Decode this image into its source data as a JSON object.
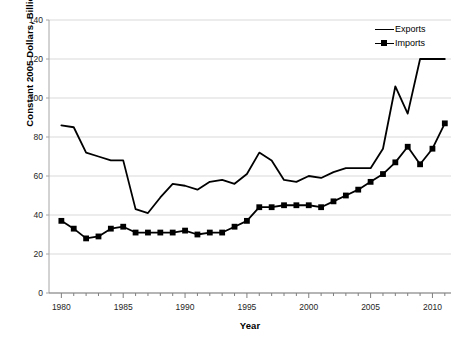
{
  "chart_data": {
    "type": "line",
    "title": "",
    "xlabel": "Year",
    "ylabel": "Constant 2005 Dollars, Billions",
    "xlim": [
      1979,
      2011.5
    ],
    "ylim": [
      0,
      140
    ],
    "ytick_values": [
      0,
      20,
      40,
      60,
      80,
      100,
      120,
      140
    ],
    "ytick_labels": [
      "0",
      "20",
      "40",
      "60",
      "80",
      "100",
      "120",
      "140"
    ],
    "xtick_values": [
      1980,
      1985,
      1990,
      1995,
      2000,
      2005,
      2010
    ],
    "xtick_labels": [
      "1980",
      "1985",
      "1990",
      "1995",
      "2000",
      "2005",
      "2010"
    ],
    "minor_xticks_every": 1,
    "grid": "horizontal",
    "legend_position": "top-right",
    "line_color": "#000000",
    "grid_color": "#d9d9d9",
    "x": [
      1980,
      1981,
      1982,
      1983,
      1984,
      1985,
      1986,
      1987,
      1988,
      1989,
      1990,
      1991,
      1992,
      1993,
      1994,
      1995,
      1996,
      1997,
      1998,
      1999,
      2000,
      2001,
      2002,
      2003,
      2004,
      2005,
      2006,
      2007,
      2008,
      2009,
      2010,
      2011
    ],
    "series": [
      {
        "name": "Exports",
        "marker": "none",
        "values": [
          86,
          85,
          72,
          70,
          68,
          68,
          43,
          41,
          49,
          56,
          55,
          53,
          57,
          58,
          56,
          61,
          72,
          68,
          58,
          57,
          60,
          59,
          62,
          64,
          64,
          64,
          74,
          106,
          92,
          120,
          120,
          120
        ]
      },
      {
        "name": "Imports",
        "marker": "square",
        "values": [
          37,
          33,
          28,
          29,
          33,
          34,
          31,
          31,
          31,
          31,
          32,
          30,
          31,
          31,
          34,
          37,
          44,
          44,
          45,
          45,
          45,
          44,
          47,
          50,
          53,
          57,
          61,
          67,
          75,
          66,
          74,
          87
        ]
      }
    ]
  },
  "legend": {
    "items": [
      {
        "label": "Exports",
        "marker": "line"
      },
      {
        "label": "Imports",
        "marker": "line-square"
      }
    ]
  }
}
